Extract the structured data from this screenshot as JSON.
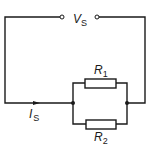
{
  "diagram": {
    "type": "circuit",
    "source": {
      "label": "V",
      "subscript": "S"
    },
    "current": {
      "label": "I",
      "subscript": "S"
    },
    "resistors": [
      {
        "label": "R",
        "subscript": "1"
      },
      {
        "label": "R",
        "subscript": "2"
      }
    ],
    "colors": {
      "line": "#1a1a1a",
      "background": "#ffffff"
    }
  }
}
